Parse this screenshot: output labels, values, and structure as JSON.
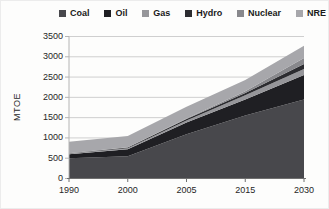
{
  "chart_data": {
    "type": "area",
    "stacked": true,
    "title": "",
    "ylabel": "MTOE",
    "xlabel": "",
    "categories": [
      "1990",
      "2000",
      "2005",
      "2015",
      "2030"
    ],
    "series": [
      {
        "name": "Coal",
        "color": "#48484c",
        "values": [
          500,
          550,
          1090,
          1550,
          1950
        ]
      },
      {
        "name": "Oil",
        "color": "#1f1f23",
        "values": [
          100,
          170,
          290,
          400,
          600
        ]
      },
      {
        "name": "Gas",
        "color": "#96969a",
        "values": [
          15,
          25,
          50,
          100,
          150
        ]
      },
      {
        "name": "Hydro",
        "color": "#2c2c30",
        "values": [
          10,
          20,
          35,
          60,
          120
        ]
      },
      {
        "name": "Nuclear",
        "color": "#88888c",
        "values": [
          0,
          5,
          15,
          40,
          150
        ]
      },
      {
        "name": "NRE",
        "color": "#a7a7ab",
        "values": [
          280,
          280,
          290,
          280,
          300
        ]
      }
    ],
    "ylim": [
      0,
      3500
    ],
    "ytick_step": 500,
    "grid": true,
    "legend_position": "top",
    "gridline_color": "#cfcfcf",
    "axis_color": "#6f6f6f",
    "yaxis_line_color": "#b4b4b4"
  }
}
